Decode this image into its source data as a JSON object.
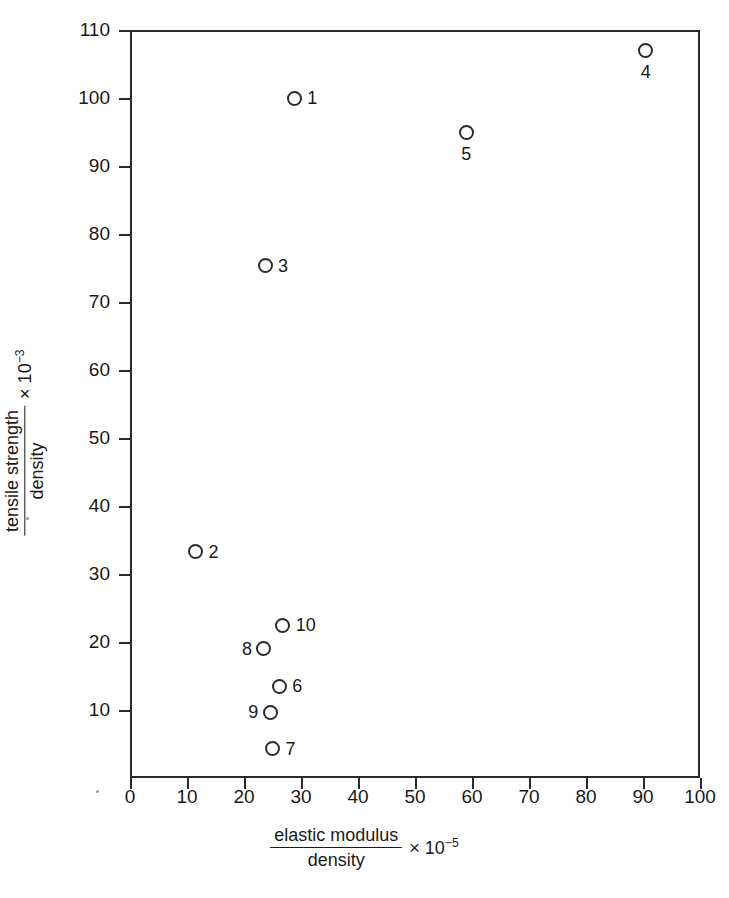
{
  "chart_data": {
    "type": "scatter",
    "title": "",
    "xlabel": "elastic modulus / density × 10^-5",
    "ylabel": "tensile strength / density × 10^-3",
    "xlabel_parts": {
      "numerator": "elastic modulus",
      "denominator": "density",
      "multiplier": "×",
      "base": "10",
      "exponent": "−5"
    },
    "ylabel_parts": {
      "numerator": "tensile strength",
      "denominator": "density",
      "multiplier": "×",
      "base": "10",
      "exponent": "−3"
    },
    "xlim": [
      0,
      100
    ],
    "ylim": [
      0,
      110
    ],
    "xticks": [
      0,
      10,
      20,
      30,
      40,
      50,
      60,
      70,
      80,
      90,
      100
    ],
    "yticks": [
      10,
      20,
      30,
      40,
      50,
      60,
      70,
      80,
      90,
      100,
      110
    ],
    "xtick_labels": [
      "0",
      "10",
      "20",
      "30",
      "40",
      "50",
      "60",
      "70",
      "80",
      "90",
      "100"
    ],
    "ytick_labels": [
      "10",
      "20",
      "30",
      "40",
      "50",
      "60",
      "70",
      "80",
      "90",
      "100",
      "110"
    ],
    "grid": false,
    "legend": false,
    "marker": "open-circle",
    "marker_color": "#2b2b2b",
    "points": [
      {
        "label": "1",
        "x": 28.8,
        "y": 100.0,
        "label_pos": "right"
      },
      {
        "label": "2",
        "x": 11.5,
        "y": 33.3,
        "label_pos": "right"
      },
      {
        "label": "3",
        "x": 23.7,
        "y": 75.3,
        "label_pos": "right"
      },
      {
        "label": "4",
        "x": 90.5,
        "y": 107.0,
        "label_pos": "below"
      },
      {
        "label": "5",
        "x": 59.0,
        "y": 95.0,
        "label_pos": "below"
      },
      {
        "label": "6",
        "x": 26.2,
        "y": 13.5,
        "label_pos": "right"
      },
      {
        "label": "7",
        "x": 25.0,
        "y": 4.3,
        "label_pos": "right"
      },
      {
        "label": "8",
        "x": 23.5,
        "y": 19.0,
        "label_pos": "left"
      },
      {
        "label": "9",
        "x": 24.6,
        "y": 9.7,
        "label_pos": "left"
      },
      {
        "label": "10",
        "x": 26.8,
        "y": 22.5,
        "label_pos": "right"
      }
    ]
  }
}
